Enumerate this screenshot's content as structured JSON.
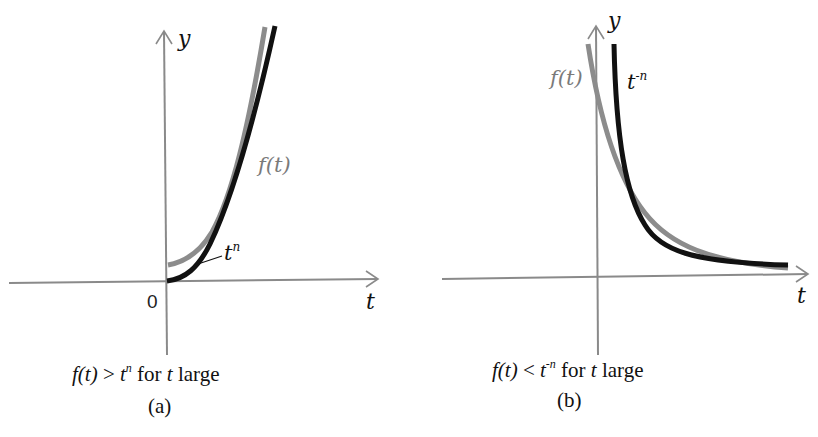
{
  "colors": {
    "axis": "#8a8a8a",
    "f_curve": "#8c8c8c",
    "t_curve": "#111111",
    "text": "#111111",
    "f_label": "#7a7a7a"
  },
  "panel_a": {
    "y_axis_label": "y",
    "x_axis_label": "t",
    "origin_label": "0",
    "f_label": "f(t)",
    "t_label_base": "t",
    "t_label_exp": "n",
    "caption": {
      "f": "f(t)",
      "rel": ">",
      "t": "t",
      "exp": "n",
      "for": "for",
      "tvar": "t",
      "large": "large"
    },
    "sublabel": "(a)"
  },
  "panel_b": {
    "y_axis_label": "y",
    "x_axis_label": "t",
    "f_label": "f(t)",
    "t_label_base": "t",
    "t_label_exp": "-n",
    "caption": {
      "f": "f(t)",
      "rel": "<",
      "t": "t",
      "exp": "-n",
      "for": "for",
      "tvar": "t",
      "large": "large"
    },
    "sublabel": "(b)"
  }
}
